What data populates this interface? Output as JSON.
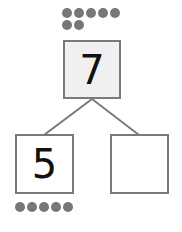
{
  "diagram": {
    "type": "number-bond",
    "whole": {
      "value": "7",
      "dots": 7
    },
    "parts": [
      {
        "value": "5",
        "dots": 5
      },
      {
        "value": "",
        "dots": 0
      }
    ],
    "colors": {
      "dot": "#777777",
      "border": "#7a7a7a",
      "whole_fill": "#f0f0f0",
      "line": "#7a7a7a"
    }
  }
}
